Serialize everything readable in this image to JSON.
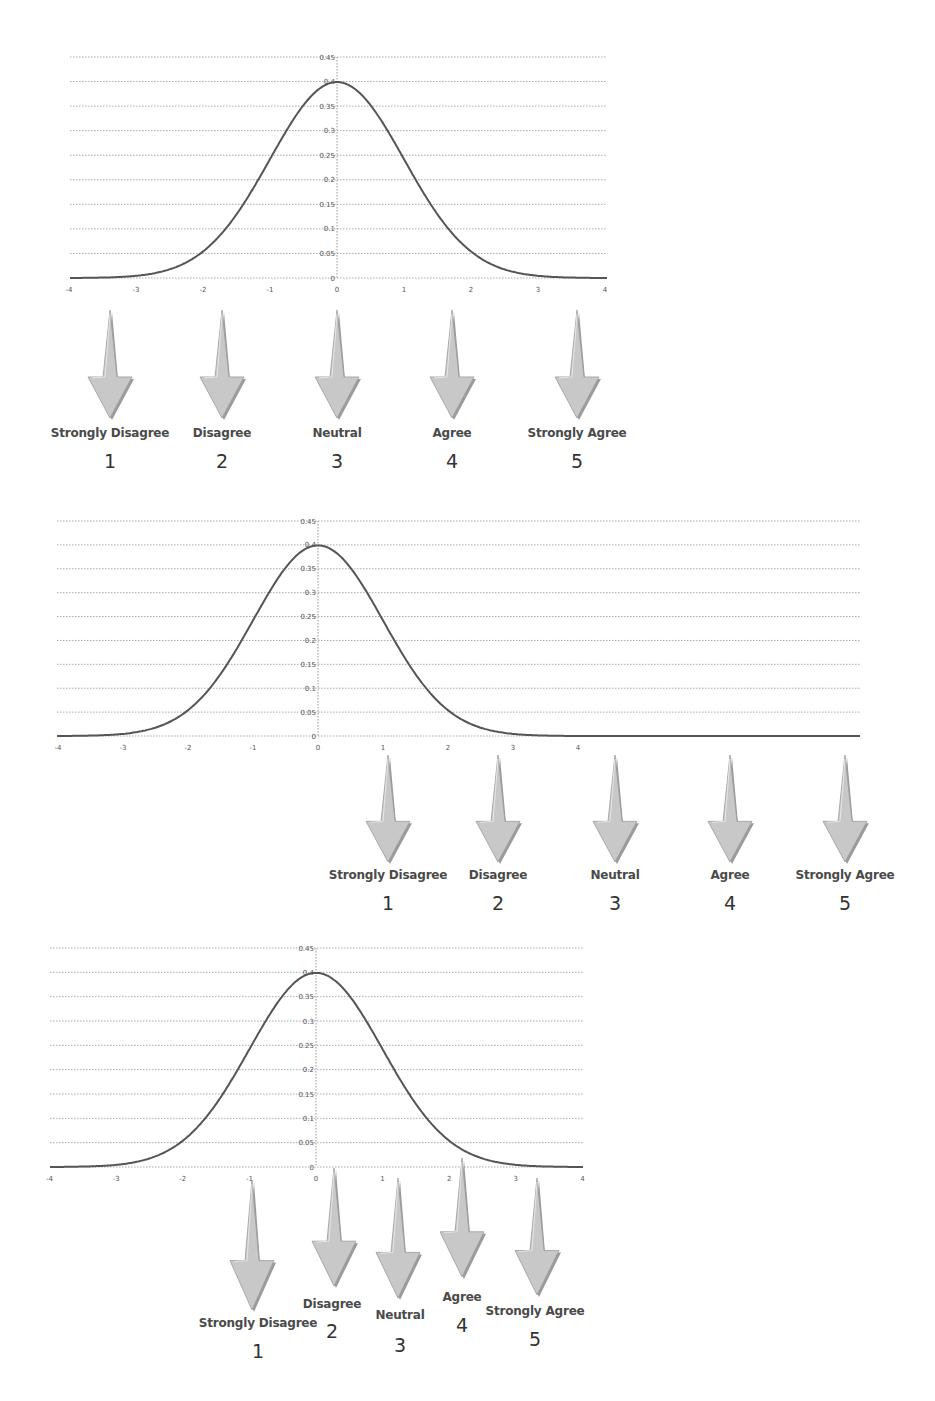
{
  "figure": {
    "curve_color": "#555555",
    "grid_color": "#aaaaaa",
    "arrow_fill": "#c8c8c8",
    "arrow_shadow": "#7a7a7a"
  },
  "panels": [
    {
      "id": "panel-1",
      "y_ticks": [
        "0.45",
        "0.4",
        "0.35",
        "0.3",
        "0.25",
        "0.2",
        "0.15",
        "0.1",
        "0.05",
        "0"
      ],
      "x_ticks": [
        "-4",
        "-3",
        "-2",
        "-1",
        "0",
        "1",
        "2",
        "3",
        "4"
      ],
      "scale": [
        {
          "label": "Strongly Disagree",
          "value": "1"
        },
        {
          "label": "Disagree",
          "value": "2"
        },
        {
          "label": "Neutral",
          "value": "3"
        },
        {
          "label": "Agree",
          "value": "4"
        },
        {
          "label": "Strongly Agree",
          "value": "5"
        }
      ]
    },
    {
      "id": "panel-2",
      "y_ticks": [
        "0.45",
        "0.4",
        "0.35",
        "0.3",
        "0.25",
        "0.2",
        "0.15",
        "0.1",
        "0.05",
        "0"
      ],
      "x_ticks": [
        "-4",
        "-3",
        "-2",
        "-1",
        "0",
        "1",
        "2",
        "3",
        "4"
      ],
      "scale": [
        {
          "label": "Strongly Disagree",
          "value": "1"
        },
        {
          "label": "Disagree",
          "value": "2"
        },
        {
          "label": "Neutral",
          "value": "3"
        },
        {
          "label": "Agree",
          "value": "4"
        },
        {
          "label": "Strongly Agree",
          "value": "5"
        }
      ]
    },
    {
      "id": "panel-3",
      "y_ticks": [
        "0.45",
        "0.4",
        "0.35",
        "0.3",
        "0.25",
        "0.2",
        "0.15",
        "0.1",
        "0.05",
        "0"
      ],
      "x_ticks": [
        "-4",
        "-3",
        "-2",
        "-1",
        "0",
        "1",
        "2",
        "3",
        "4"
      ],
      "scale": [
        {
          "label": "Strongly Disagree",
          "value": "1"
        },
        {
          "label": "Disagree",
          "value": "2"
        },
        {
          "label": "Neutral",
          "value": "3"
        },
        {
          "label": "Agree",
          "value": "4"
        },
        {
          "label": "Strongly Agree",
          "value": "5"
        }
      ]
    }
  ],
  "chart_data": [
    {
      "type": "line",
      "title": "",
      "series": [
        {
          "name": "Standard normal PDF",
          "x": [
            -4,
            -3,
            -2,
            -1,
            0,
            1,
            2,
            3,
            4
          ],
          "values": [
            0.0001,
            0.0044,
            0.054,
            0.242,
            0.399,
            0.242,
            0.054,
            0.0044,
            0.0001
          ]
        }
      ],
      "xlabel": "",
      "ylabel": "",
      "xlim": [
        -4,
        4
      ],
      "ylim": [
        0,
        0.45
      ],
      "grid": true,
      "annotations": [
        "Strongly Disagree 1 at x≈-3.4",
        "Disagree 2 at x≈-1.7",
        "Neutral 3 at x≈0",
        "Agree 4 at x≈1.7",
        "Strongly Agree 5 at x≈3.6"
      ]
    },
    {
      "type": "line",
      "title": "",
      "series": [
        {
          "name": "Standard normal PDF",
          "x": [
            -4,
            -3,
            -2,
            -1,
            0,
            1,
            2,
            3,
            4
          ],
          "values": [
            0.0001,
            0.0044,
            0.054,
            0.242,
            0.399,
            0.242,
            0.054,
            0.0044,
            0.0001
          ]
        }
      ],
      "xlabel": "",
      "ylabel": "",
      "xlim": [
        -4,
        8.4
      ],
      "ylim": [
        0,
        0.45
      ],
      "grid": true,
      "annotations": [
        "Strongly Disagree 1 at x≈1.1",
        "Disagree 2 at x≈2.8",
        "Neutral 3 at x≈4.6",
        "Agree 4 at x≈6.3",
        "Strongly Agree 5 at x≈8.1"
      ]
    },
    {
      "type": "line",
      "title": "",
      "series": [
        {
          "name": "Standard normal PDF",
          "x": [
            -4,
            -3,
            -2,
            -1,
            0,
            1,
            2,
            3,
            4
          ],
          "values": [
            0.0001,
            0.0044,
            0.054,
            0.242,
            0.399,
            0.242,
            0.054,
            0.0044,
            0.0001
          ]
        }
      ],
      "xlabel": "",
      "ylabel": "",
      "xlim": [
        -4,
        4
      ],
      "ylim": [
        0,
        0.45
      ],
      "grid": true,
      "annotations": [
        "Strongly Disagree 1 at x≈-1",
        "Disagree 2 at x≈0.3",
        "Neutral 3 at x≈1.2",
        "Agree 4 at x≈2.2",
        "Strongly Agree 5 at x≈3.3"
      ]
    }
  ]
}
